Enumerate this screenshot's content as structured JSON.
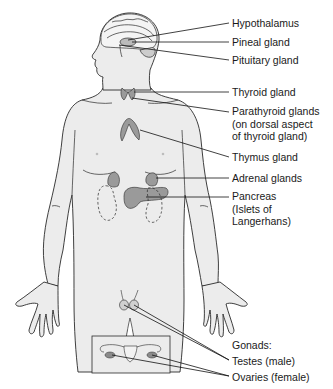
{
  "figure": {
    "colors": {
      "body_fill": "#ececec",
      "outline": "#2a2a2a",
      "gland_fill": "#9a9a9a",
      "leader": "#111111",
      "background": "#ffffff"
    }
  },
  "labels": {
    "hypothalamus": "Hypothalamus",
    "pineal": "Pineal gland",
    "pituitary": "Pituitary gland",
    "thyroid": "Thyroid gland",
    "parathyroid": [
      "Parathyroid glands",
      "(on dorsal aspect",
      "of thyroid gland)"
    ],
    "thymus": "Thymus gland",
    "adrenal": "Adrenal glands",
    "pancreas": [
      "Pancreas",
      "(Islets of",
      "Langerhans)"
    ],
    "gonads_heading": "Gonads:",
    "testes": "Testes (male)",
    "ovaries": "Ovaries (female)"
  }
}
